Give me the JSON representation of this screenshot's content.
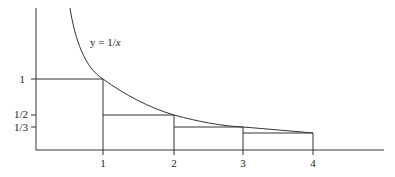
{
  "figure": {
    "curve_label": "y = 1/x",
    "curve_label_prefix": "y = 1/",
    "curve_label_var": "x",
    "function": "1/x",
    "colors": {
      "stroke": "#333333",
      "background": "#ffffff",
      "text": "#222222"
    }
  },
  "axes": {
    "x_ticks": [
      "1",
      "2",
      "3",
      "4"
    ],
    "y_ticks": [
      "1",
      "1/2",
      "1/3"
    ]
  },
  "rectangles": [
    {
      "x_from": "0",
      "x_to": "1",
      "height": "1"
    },
    {
      "x_from": "1",
      "x_to": "2",
      "height": "1/2"
    },
    {
      "x_from": "2",
      "x_to": "3",
      "height": "1/3"
    },
    {
      "x_from": "3",
      "x_to": "4",
      "height": "1/4"
    }
  ]
}
